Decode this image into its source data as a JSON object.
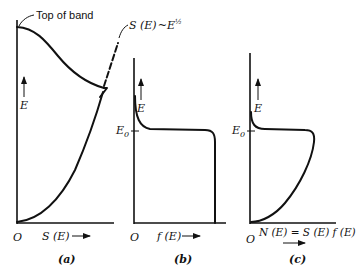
{
  "figure": {
    "panels": [
      {
        "id": "a",
        "caption": "(a)",
        "x_axis_label": "S (E)",
        "y_axis_label": "E",
        "origin_label": "O",
        "annotations": {
          "top_of_band": "Top of band",
          "density_formula_main": "S (E)",
          "density_formula_tilde": "~",
          "density_formula_base": "E",
          "density_formula_exponent": "½"
        }
      },
      {
        "id": "b",
        "caption": "(b)",
        "x_axis_label": "f (E)",
        "y_axis_label": "E",
        "origin_label": "O",
        "level_label": "E",
        "level_subscript": "0"
      },
      {
        "id": "c",
        "caption": "(c)",
        "x_axis_label": "N (E) = S (E) f (E)",
        "y_axis_label": "E",
        "origin_label": "O",
        "level_label": "E",
        "level_subscript": "0"
      }
    ],
    "colors": {
      "ink": "#111111",
      "background": "#ffffff"
    }
  }
}
